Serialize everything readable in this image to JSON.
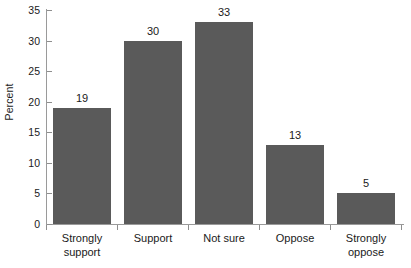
{
  "chart_data": {
    "type": "bar",
    "title": "",
    "xlabel": "",
    "ylabel": "Percent",
    "categories": [
      "Strongly support",
      "Support",
      "Not sure",
      "Oppose",
      "Strongly oppose"
    ],
    "category_lines": [
      [
        "Strongly",
        "support"
      ],
      [
        "Support",
        ""
      ],
      [
        "Not sure",
        ""
      ],
      [
        "Oppose",
        ""
      ],
      [
        "Strongly",
        "oppose"
      ]
    ],
    "values": [
      19,
      30,
      33,
      13,
      5
    ],
    "value_labels": [
      "19",
      "30",
      "33",
      "13",
      "5"
    ],
    "ylim": [
      0,
      35
    ],
    "ytick_values": [
      0,
      5,
      10,
      15,
      20,
      25,
      30,
      35
    ],
    "ytick_labels": [
      "0",
      "5",
      "10",
      "15",
      "20",
      "25",
      "30",
      "35"
    ],
    "grid": false,
    "legend": false,
    "bar_color": "#5a5a5a",
    "axis_color": "#9a9a9a",
    "background_color": "#ffffff",
    "text_color": "#1a1a1a"
  }
}
